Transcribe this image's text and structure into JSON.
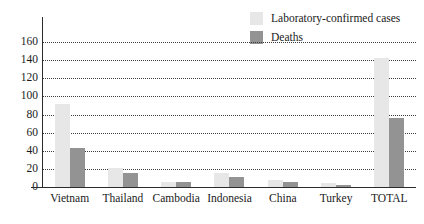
{
  "chart_data": {
    "type": "bar",
    "title": "",
    "xlabel": "",
    "ylabel": "",
    "categories": [
      "Vietnam",
      "Thailand",
      "Cambodia",
      "Indonesia",
      "China",
      "Turkey",
      "TOTAL"
    ],
    "series": [
      {
        "name": "Laboratory-confirmed cases",
        "color": "#e7e7e7",
        "values": [
          92,
          21,
          6,
          15,
          8,
          4,
          142
        ]
      },
      {
        "name": "Deaths",
        "color": "#939393",
        "values": [
          43,
          15,
          6,
          11,
          6,
          2,
          76
        ]
      }
    ],
    "ylim": [
      0,
      160
    ],
    "yticks": [
      0,
      20,
      40,
      60,
      80,
      100,
      120,
      140,
      160
    ],
    "grid": true,
    "grid_style": "dotted-horizontal",
    "legend_position": "top-right"
  },
  "legend": {
    "items": [
      {
        "label": "Laboratory-confirmed cases",
        "color": "#e7e7e7"
      },
      {
        "label": "Deaths",
        "color": "#939393"
      }
    ]
  },
  "axis": {
    "line_color": "#2b2b2b",
    "grid_color": "#3a3a3a"
  }
}
